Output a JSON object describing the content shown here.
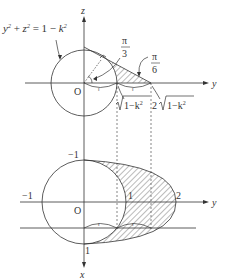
{
  "top_diagram": {
    "equation": "y² + z² = 1 − k²",
    "equation_parts": {
      "y": "y",
      "z": "z",
      "exp": "2",
      "rhs": "= 1 − k",
      "plus": "+"
    },
    "axis_z": "z",
    "axis_y": "y",
    "origin": "O",
    "angle_pi3_num": "π",
    "angle_pi3_den": "3",
    "angle_pi6_num": "π",
    "angle_pi6_den": "6",
    "label_sqrt": "√1−k²",
    "label_sqrt_body": "1−k",
    "label_2sqrt_coef": "2",
    "label_2sqrt_body": "1−k",
    "sup2": "2",
    "tick_mark": "″"
  },
  "bottom_diagram": {
    "axis_y": "y",
    "axis_x": "x",
    "origin": "O",
    "tick_neg1_top": "−1",
    "tick_neg1_left": "−1",
    "tick_1_y": "1",
    "tick_2_y": "2",
    "tick_1_x": "1"
  },
  "colors": {
    "line": "#333333",
    "hatch": "#555555"
  }
}
